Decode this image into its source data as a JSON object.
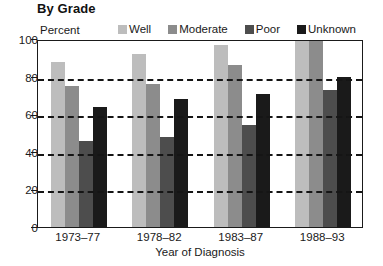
{
  "chart_data": {
    "type": "bar",
    "title": "By Grade",
    "xlabel": "Year of Diagnosis",
    "ylabel": "Percent",
    "categories": [
      "1973–77",
      "1978–82",
      "1983–87",
      "1988–93"
    ],
    "series": [
      {
        "name": "Well",
        "color": "#bdbdbd",
        "values": [
          88,
          92,
          97,
          100
        ]
      },
      {
        "name": "Moderate",
        "color": "#8c8c8c",
        "values": [
          75,
          76,
          86,
          100
        ]
      },
      {
        "name": "Poor",
        "color": "#4d4d4d",
        "values": [
          46,
          48,
          54,
          73
        ]
      },
      {
        "name": "Unknown",
        "color": "#1a1a1a",
        "values": [
          64,
          68,
          71,
          80
        ]
      }
    ],
    "ylim": [
      0,
      100
    ],
    "yticks": [
      0,
      20,
      40,
      60,
      80,
      100
    ],
    "ytick_labels": [
      "0",
      "20",
      "40",
      "60",
      "80",
      "100"
    ],
    "gridlines": [
      20,
      40,
      60,
      80
    ],
    "grid": true,
    "legend_position": "top"
  }
}
